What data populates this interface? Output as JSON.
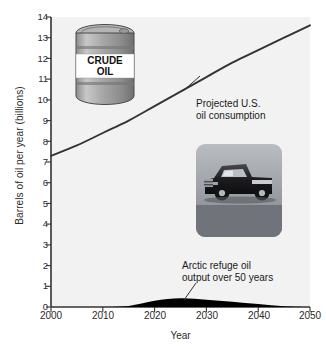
{
  "chart_data": {
    "type": "area",
    "title": "",
    "xlabel": "Year",
    "ylabel": "Barrels of oil per year (billions)",
    "xlim": [
      2000,
      2050
    ],
    "ylim": [
      0,
      14
    ],
    "grid": false,
    "legend_position": "none",
    "xticks": [
      "2000",
      "2010",
      "2020",
      "2030",
      "2040",
      "2050"
    ],
    "xtick_values": [
      2000,
      2010,
      2020,
      2030,
      2040,
      2050
    ],
    "yticks": [
      "0",
      "1",
      "2",
      "3",
      "4",
      "5",
      "6",
      "7",
      "8",
      "9",
      "10",
      "11",
      "12",
      "13",
      "14"
    ],
    "ytick_values": [
      0,
      1,
      2,
      3,
      4,
      5,
      6,
      7,
      8,
      9,
      10,
      11,
      12,
      13,
      14
    ],
    "x": [
      2000,
      2005,
      2010,
      2015,
      2020,
      2025,
      2030,
      2035,
      2040,
      2045,
      2050
    ],
    "series": [
      {
        "name": "Projected U.S. oil consumption",
        "render": "line",
        "values": [
          7.3,
          7.8,
          8.4,
          9.0,
          9.7,
          10.4,
          11.1,
          11.8,
          12.4,
          13.0,
          13.6
        ]
      },
      {
        "name": "Arctic refuge oil output over 50 years",
        "render": "filled-area",
        "values": [
          0.0,
          0.0,
          0.0,
          0.05,
          0.3,
          0.42,
          0.35,
          0.25,
          0.14,
          0.04,
          0.0
        ]
      }
    ],
    "annotations": [
      {
        "id": "consumption",
        "text": "Projected U.S.\noil consumption",
        "x": 2028,
        "y": 9.9,
        "leader": true
      },
      {
        "id": "arctic",
        "text": "Arctic refuge oil\noutput over 50 years",
        "x": 2026,
        "y": 1.9,
        "leader": true
      }
    ],
    "images": [
      {
        "id": "crude-oil-barrel",
        "caption_line1": "CRUDE",
        "caption_line2": "OIL",
        "x": 2005,
        "y": 11.8
      },
      {
        "id": "pickup-truck-photo",
        "caption": "",
        "x": 2029,
        "y": 6.0
      }
    ],
    "colors": {
      "line": "#333333",
      "area_fill": "#000000",
      "plot_background": "#f2f2f2",
      "axis": "#333333",
      "text": "#1a1a1a",
      "page_background": "#ffffff"
    }
  }
}
